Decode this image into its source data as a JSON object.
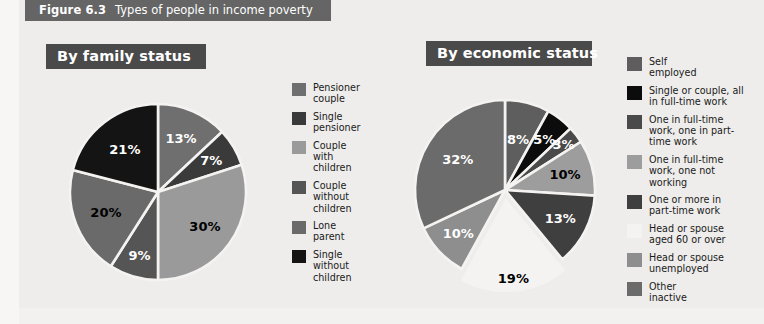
{
  "figure": {
    "number": "Figure 6.3",
    "title": "Types of people in income poverty"
  },
  "panels": {
    "family": {
      "title": "By family status"
    },
    "economic": {
      "title": "By economic status"
    }
  },
  "colors": {
    "background": "#eeedeb",
    "title_bar": "#656565",
    "panel_bar": "#4a4a4a",
    "slice_gap": "#f4f3f1"
  },
  "chart_data": [
    {
      "type": "pie",
      "title": "By family status",
      "legend_position": "right",
      "labels": [
        "Pensioner\ncouple",
        "Single\npensioner",
        "Couple\nwith\nchildren",
        "Couple\nwithout\nchildren",
        "Lone\nparent",
        "Single\nwithout\nchildren"
      ],
      "values": [
        13,
        7,
        30,
        9,
        20,
        21
      ],
      "value_labels": [
        "13%",
        "7%",
        "30%",
        "9%",
        "20%",
        "21%"
      ],
      "colors": [
        "#6f6f6f",
        "#3a3a3a",
        "#9a9a9a",
        "#555555",
        "#6a6a6a",
        "#141414"
      ],
      "label_colors": [
        "#ffffff",
        "#ffffff",
        "#000000",
        "#ffffff",
        "#000000",
        "#ffffff"
      ],
      "exploded": [
        false,
        false,
        false,
        false,
        false,
        false
      ]
    },
    {
      "type": "pie",
      "title": "By economic status",
      "legend_position": "right",
      "labels": [
        "Self\nemployed",
        "Single or couple, all\nin full-time work",
        "One in full-time\nwork, one in part-\ntime work",
        "One in full-time\nwork, one not\nworking",
        "One or more in\npart-time work",
        "Head or spouse\naged 60 or over",
        "Head or spouse\nunemployed",
        "Other\ninactive"
      ],
      "values": [
        8,
        5,
        3,
        10,
        13,
        19,
        10,
        32
      ],
      "value_labels": [
        "8%",
        "5%",
        "3%",
        "10%",
        "13%",
        "19%",
        "10%",
        "32%"
      ],
      "colors": [
        "#5e5e5e",
        "#0c0c0c",
        "#4a4a4a",
        "#9d9d9d",
        "#3f3f3f",
        "#f4f3f1",
        "#8e8e8e",
        "#6b6b6b"
      ],
      "label_colors": [
        "#ffffff",
        "#ffffff",
        "#ffffff",
        "#000000",
        "#ffffff",
        "#000000",
        "#ffffff",
        "#ffffff"
      ],
      "exploded": [
        false,
        false,
        false,
        false,
        false,
        true,
        false,
        false
      ]
    }
  ]
}
